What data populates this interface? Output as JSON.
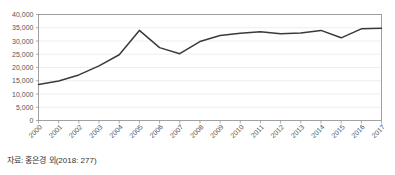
{
  "chart_data": {
    "type": "line",
    "title": "",
    "subtitle": "",
    "xlabel": "",
    "ylabel": "",
    "categories": [
      "2000",
      "2001",
      "2002",
      "2003",
      "2004",
      "2005",
      "2006",
      "2007",
      "2008",
      "2009",
      "2010",
      "2011",
      "2012",
      "2013",
      "2014",
      "2015",
      "2016",
      "2017"
    ],
    "values": [
      13600,
      14900,
      17200,
      20600,
      24800,
      34000,
      27500,
      25200,
      29800,
      32100,
      32900,
      33500,
      32700,
      33000,
      34000,
      31200,
      34600,
      34800
    ],
    "series": [
      {
        "name": "",
        "values": [
          13600,
          14900,
          17200,
          20600,
          24800,
          34000,
          27500,
          25200,
          29800,
          32100,
          32900,
          33500,
          32700,
          33000,
          34000,
          31200,
          34600,
          34800
        ]
      }
    ],
    "ylim": [
      0,
      40000
    ],
    "ytick_labels": [
      "0",
      "5,000",
      "10,000",
      "15,000",
      "20,000",
      "25,000",
      "30,000",
      "35,000",
      "40,000"
    ],
    "ytick_values": [
      0,
      5000,
      10000,
      15000,
      20000,
      25000,
      30000,
      35000,
      40000
    ],
    "grid": true,
    "legend": false,
    "legend_position": "none",
    "line_color": "#3a3a3a",
    "grid_color": "#e6e6e6",
    "axis_color": "#8a8a8a"
  },
  "caption": {
    "source_note": "자료: 홍은경 외(2018: 277)"
  }
}
